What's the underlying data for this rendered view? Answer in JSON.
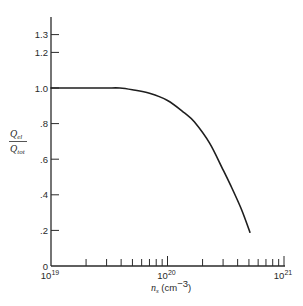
{
  "chart_data": {
    "type": "line",
    "title": "",
    "xlabel": "n_s (cm^-3)",
    "ylabel": "Q_el / Q_tot",
    "xscale": "log",
    "xlim": [
      1e+19,
      1e+21
    ],
    "ylim": [
      0,
      1.3
    ],
    "grid": false,
    "legend": null,
    "x_tick_labels": [
      "10^19",
      "10^20",
      "10^21"
    ],
    "y_tick_labels": [
      "0",
      ".2",
      ".4",
      ".6",
      ".8",
      "1.0",
      "1.2",
      "1.3"
    ],
    "series": [
      {
        "name": "Q_el/Q_tot",
        "x": [
          1e+19,
          2e+19,
          3e+19,
          3.9e+19,
          5e+19,
          7e+19,
          1e+20,
          1.4e+20,
          1.7e+20,
          2.3e+20,
          3e+20,
          3.5e+20,
          4.3e+20,
          5.1e+20
        ],
        "y": [
          1.0,
          1.0,
          1.0,
          1.0,
          0.99,
          0.97,
          0.93,
          0.86,
          0.81,
          0.69,
          0.54,
          0.45,
          0.32,
          0.19
        ]
      }
    ]
  },
  "labels": {
    "y_ticks": [
      {
        "text": "1.3",
        "value": 1.3
      },
      {
        "text": "1.2",
        "value": 1.2
      },
      {
        "text": "1.0",
        "value": 1.0
      },
      {
        "text": ".8",
        "value": 0.8
      },
      {
        "text": ".6",
        "value": 0.6
      },
      {
        "text": ".4",
        "value": 0.4
      },
      {
        "text": ".2",
        "value": 0.2
      },
      {
        "text": "0",
        "value": 0
      }
    ],
    "x_major": [
      {
        "base": "10",
        "exp": "19"
      },
      {
        "base": "10",
        "exp": "20"
      },
      {
        "base": "10",
        "exp": "21"
      }
    ],
    "ylabel_num_main": "Q",
    "ylabel_num_sub": "el",
    "ylabel_den_main": "Q",
    "ylabel_den_sub": "tot",
    "xlabel_var": "n",
    "xlabel_sub": "s",
    "xlabel_unit_open": " (cm",
    "xlabel_unit_exp": "−3",
    "xlabel_unit_close": ")"
  }
}
